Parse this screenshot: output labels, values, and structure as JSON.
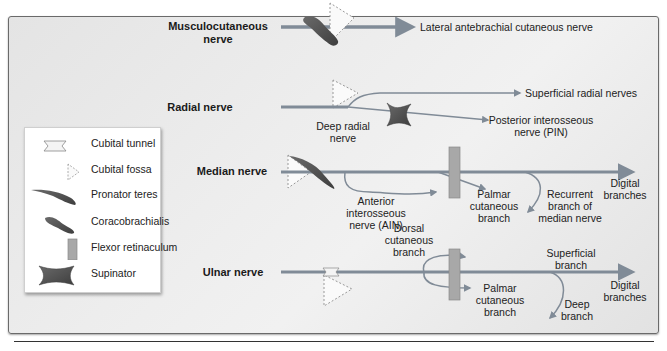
{
  "legend": {
    "items": [
      {
        "icon": "cubital-tunnel-icon",
        "label": "Cubital tunnel"
      },
      {
        "icon": "cubital-fossa-icon",
        "label": "Cubital fossa"
      },
      {
        "icon": "pronator-teres-icon",
        "label": "Pronator teres"
      },
      {
        "icon": "coracobrachialis-icon",
        "label": "Coracobrachialis"
      },
      {
        "icon": "flexor-retinaculum-icon",
        "label": "Flexor retinaculum"
      },
      {
        "icon": "supinator-icon",
        "label": "Supinator"
      }
    ]
  },
  "colors": {
    "nerve": "#808b97",
    "muscle": "#555555",
    "retinaculum": "#a8a8a8",
    "fossa_outline": "#999999",
    "panel_border": "#6a6a6a"
  },
  "nerves": {
    "musculocutaneous": {
      "name_line1": "Musculocutaneous",
      "name_line2": "nerve",
      "branch": "Lateral antebrachial cutaneous nerve"
    },
    "radial": {
      "name": "Radial nerve",
      "deep_line1": "Deep radial",
      "deep_line2": "nerve",
      "superficial": "Superficial radial nerves",
      "pin_line1": "Posterior interosseous",
      "pin_line2": "nerve (PIN)"
    },
    "median": {
      "name": "Median nerve",
      "ain_line1": "Anterior",
      "ain_line2": "interosseous",
      "ain_line3": "nerve (AIN)",
      "palmar_line1": "Palmar",
      "palmar_line2": "cutaneous",
      "palmar_line3": "branch",
      "recurrent_line1": "Recurrent",
      "recurrent_line2": "branch of",
      "recurrent_line3": "median nerve",
      "digital_line1": "Digital",
      "digital_line2": "branches"
    },
    "ulnar": {
      "name": "Ulnar nerve",
      "dorsal_line1": "Dorsal",
      "dorsal_line2": "cutaneous",
      "dorsal_line3": "branch",
      "superficial_line1": "Superficial",
      "superficial_line2": "branch",
      "palmar_line1": "Palmar",
      "palmar_line2": "cutaneous",
      "palmar_line3": "branch",
      "deep_line1": "Deep",
      "deep_line2": "branch",
      "digital_line1": "Digital",
      "digital_line2": "branches"
    }
  }
}
